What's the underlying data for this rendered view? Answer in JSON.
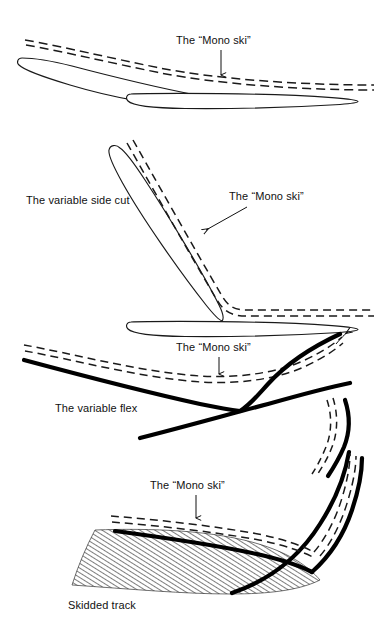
{
  "figure": {
    "background_color": "#ffffff",
    "ink_color": "#111111",
    "width": 378,
    "height": 642
  },
  "panels": [
    {
      "id": "panel-crossover",
      "index": 1,
      "annotations": [
        {
          "id": "mono-ski-1",
          "text": "The “Mono ski”",
          "text_x": 176,
          "text_y": 44,
          "arrow_from_x": 221,
          "arrow_from_y": 50,
          "arrow_to_x": 221,
          "arrow_to_y": 76
        }
      ]
    },
    {
      "id": "panel-side-cut",
      "index": 2,
      "annotations": [
        {
          "id": "variable-side-cut",
          "text": "The variable side cut",
          "text_x": 26,
          "text_y": 204,
          "arrow_from_x": 0,
          "arrow_from_y": 0,
          "arrow_to_x": 0,
          "arrow_to_y": 0
        },
        {
          "id": "mono-ski-2",
          "text": "The “Mono ski”",
          "text_x": 229,
          "text_y": 200,
          "arrow_from_x": 248,
          "arrow_from_y": 208,
          "arrow_to_x": 205,
          "arrow_to_y": 230
        }
      ]
    },
    {
      "id": "panel-variable-flex",
      "index": 3,
      "annotations": [
        {
          "id": "mono-ski-3",
          "text": "The “Mono ski”",
          "text_x": 176,
          "text_y": 351,
          "arrow_from_x": 219,
          "arrow_from_y": 357,
          "arrow_to_x": 219,
          "arrow_to_y": 375
        },
        {
          "id": "variable-flex",
          "text": "The variable flex",
          "text_x": 55,
          "text_y": 412,
          "arrow_from_x": 0,
          "arrow_from_y": 0,
          "arrow_to_x": 0,
          "arrow_to_y": 0
        }
      ]
    },
    {
      "id": "panel-skidded-track",
      "index": 4,
      "annotations": [
        {
          "id": "mono-ski-4",
          "text": "The “Mono ski”",
          "text_x": 150,
          "text_y": 489,
          "arrow_from_x": 196,
          "arrow_from_y": 495,
          "arrow_to_x": 196,
          "arrow_to_y": 519
        },
        {
          "id": "skidded-track",
          "text": "Skidded track",
          "text_x": 68,
          "text_y": 609,
          "arrow_from_x": 0,
          "arrow_from_y": 0,
          "arrow_to_x": 0,
          "arrow_to_y": 0
        }
      ]
    }
  ],
  "legend": {
    "dashed_line_meaning": "The “Mono ski”",
    "thick_line_meaning": "The variable flex",
    "hatched_area_meaning": "Skidded track",
    "solid_outline_meaning": "Conventional skis"
  }
}
